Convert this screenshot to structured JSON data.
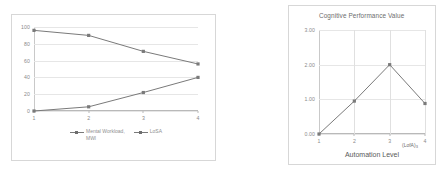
{
  "chart_data": [
    {
      "id": "mental-workload-vs-losa",
      "type": "line",
      "title": "",
      "xlabel": "",
      "ylabel": "",
      "categories": [
        "1",
        "2",
        "3",
        "4"
      ],
      "x": [
        1,
        2,
        3,
        4
      ],
      "xlim": [
        1,
        4
      ],
      "ylim": [
        0,
        100
      ],
      "yticks": [
        "0",
        "20",
        "40",
        "60",
        "80",
        "100"
      ],
      "ytick_values": [
        0,
        20,
        40,
        60,
        80,
        100
      ],
      "xticks": [
        "1",
        "2",
        "3",
        "4"
      ],
      "grid": "horizontal",
      "legend_position": "bottom-center",
      "series": [
        {
          "name": "Mental Workload,\nMWl",
          "values": [
            96,
            90,
            71,
            56
          ],
          "color": "#7a7a7a",
          "marker": "square"
        },
        {
          "name": "LoSA",
          "values": [
            0,
            5,
            22,
            40
          ],
          "color": "#7a7a7a",
          "marker": "square"
        }
      ]
    },
    {
      "id": "cognitive-performance-value",
      "type": "line",
      "title": "Cognitive Performance Value",
      "xlabel": "Automation Level",
      "xlabel_note": "(LofA)",
      "xlabel_note_sub": "3",
      "ylabel": "",
      "categories": [
        "1",
        "2",
        "3",
        "4"
      ],
      "x": [
        1,
        2,
        3,
        4
      ],
      "xlim": [
        1,
        4
      ],
      "ylim": [
        0,
        3
      ],
      "yticks": [
        "0.00",
        "1.00",
        "2.00",
        "3.00"
      ],
      "ytick_values": [
        0,
        1,
        2,
        3
      ],
      "xticks": [
        "1",
        "2",
        "3",
        "4"
      ],
      "grid": "both",
      "legend_position": "none",
      "series": [
        {
          "name": "Cognitive Performance Value",
          "values": [
            0.0,
            0.95,
            2.0,
            0.88
          ],
          "color": "#7a7a7a",
          "marker": "square"
        }
      ]
    }
  ],
  "colors": {
    "series": "#7a7a7a",
    "grid": "#e6e6e6",
    "axis": "#b9b9b9",
    "frame": "#d7d7d7",
    "tick_text": "#8a8a8a",
    "title_text": "#6d6d6d",
    "background": "#ffffff"
  }
}
